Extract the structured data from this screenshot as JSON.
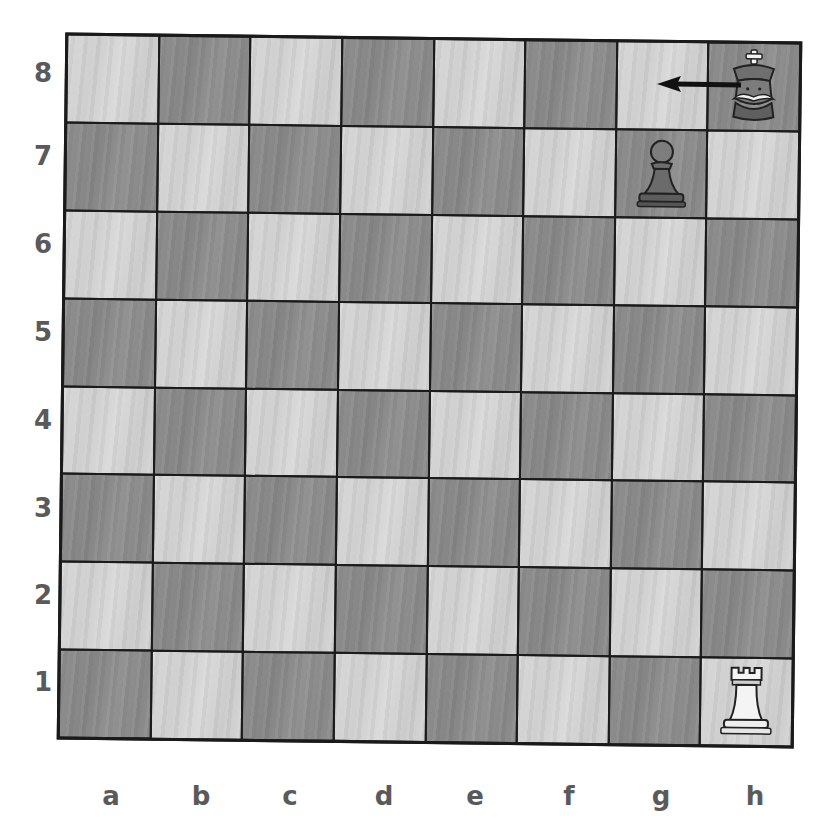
{
  "board": {
    "orientation": "white-bottom",
    "files": [
      "a",
      "b",
      "c",
      "d",
      "e",
      "f",
      "g",
      "h"
    ],
    "ranks": [
      "8",
      "7",
      "6",
      "5",
      "4",
      "3",
      "2",
      "1"
    ],
    "colors": {
      "light_square": "#d4d4d4",
      "dark_square": "#8c8c8c",
      "grid_line": "#1a1a1a",
      "label": "#5a5a5a"
    }
  },
  "pieces": [
    {
      "square": "h8",
      "color": "black",
      "type": "king",
      "icon": "cartoon-king-icon"
    },
    {
      "square": "g7",
      "color": "black",
      "type": "pawn",
      "icon": "pawn-icon"
    },
    {
      "square": "h1",
      "color": "white",
      "type": "rook",
      "icon": "rook-icon"
    }
  ],
  "arrows": [
    {
      "from": "h8",
      "to": "g8",
      "color": "#111111",
      "label": "king move h8 to g8"
    }
  ]
}
